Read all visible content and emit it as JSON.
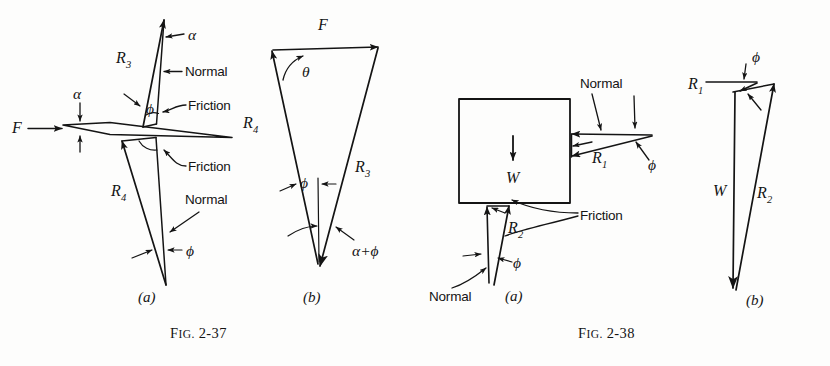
{
  "page": {
    "background_color": "#fdfdfc",
    "ink_color": "#141414",
    "width": 830,
    "height": 366
  },
  "figures": [
    {
      "id": "fig-2-37",
      "caption": "FIG. 2-37",
      "caption_prefix": "F",
      "caption_smallcaps": "IG.",
      "caption_number": " 2-37",
      "parts": [
        {
          "id": "fig-2-37-a",
          "part_label": "(a)",
          "description": "wedge free-body diagram with reaction forces R3 and R4",
          "labels": [
            {
              "name": "force-f",
              "text": "F"
            },
            {
              "name": "angle-alpha-wedge",
              "text": "α"
            },
            {
              "name": "angle-alpha-top",
              "text": "α"
            },
            {
              "name": "reaction-r3",
              "text": "R",
              "sub": "3"
            },
            {
              "name": "reaction-r4",
              "text": "R",
              "sub": "4"
            },
            {
              "name": "angle-phi-upper",
              "text": "ϕ"
            },
            {
              "name": "angle-phi-lower",
              "text": "ϕ"
            },
            {
              "name": "normal-upper",
              "text": "Normal"
            },
            {
              "name": "normal-lower",
              "text": "Normal"
            },
            {
              "name": "friction-upper",
              "text": "Friction"
            },
            {
              "name": "friction-lower",
              "text": "Friction"
            }
          ]
        },
        {
          "id": "fig-2-37-b",
          "part_label": "(b)",
          "description": "force triangle for the wedge: F, R3, R4",
          "labels": [
            {
              "name": "force-f",
              "text": "F"
            },
            {
              "name": "angle-theta",
              "text": "θ"
            },
            {
              "name": "reaction-r3",
              "text": "R",
              "sub": "3"
            },
            {
              "name": "reaction-r4",
              "text": "R",
              "sub": "4"
            },
            {
              "name": "angle-phi",
              "text": "ϕ"
            },
            {
              "name": "angle-alpha-plus-phi",
              "text": "α+ϕ"
            }
          ]
        }
      ]
    },
    {
      "id": "fig-2-38",
      "caption": "FIG. 2-38",
      "caption_prefix": "F",
      "caption_smallcaps": "IG.",
      "caption_number": " 2-38",
      "parts": [
        {
          "id": "fig-2-38-a",
          "part_label": "(a)",
          "description": "block free-body diagram with weight W and reactions R1 and R2",
          "labels": [
            {
              "name": "weight-w",
              "text": "W"
            },
            {
              "name": "reaction-r1",
              "text": "R",
              "sub": "1"
            },
            {
              "name": "reaction-r2",
              "text": "R",
              "sub": "2"
            },
            {
              "name": "angle-phi-right",
              "text": "ϕ"
            },
            {
              "name": "angle-phi-bottom",
              "text": "ϕ"
            },
            {
              "name": "normal-right",
              "text": "Normal"
            },
            {
              "name": "normal-bottom",
              "text": "Normal"
            },
            {
              "name": "friction",
              "text": "Friction"
            }
          ]
        },
        {
          "id": "fig-2-38-b",
          "part_label": "(b)",
          "description": "force triangle for the block: W, R1, R2",
          "labels": [
            {
              "name": "weight-w",
              "text": "W"
            },
            {
              "name": "reaction-r1",
              "text": "R",
              "sub": "1"
            },
            {
              "name": "reaction-r2",
              "text": "R",
              "sub": "2"
            },
            {
              "name": "angle-phi",
              "text": "ϕ"
            }
          ]
        }
      ]
    }
  ],
  "text": {
    "normal": "Normal",
    "friction": "Friction",
    "phi": "ϕ",
    "theta": "θ",
    "alpha": "α",
    "alpha_plus_phi": "α+ϕ",
    "f": "F",
    "w": "W",
    "r": "R",
    "sub1": "1",
    "sub2": "2",
    "sub3": "3",
    "sub4": "4",
    "part_a": "(a)",
    "part_b": "(b)",
    "fig_prefix": "F",
    "fig_ig": "IG.",
    "fig_37_num": " 2-37",
    "fig_38_num": " 2-38"
  }
}
